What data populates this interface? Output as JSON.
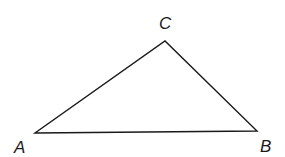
{
  "diagram": {
    "type": "triangle",
    "stroke_color": "#1a1a1a",
    "background": "#ffffff",
    "vertices": [
      {
        "name": "A",
        "x": 35,
        "y": 133,
        "label": "A",
        "label_x": 14,
        "label_y": 153
      },
      {
        "name": "B",
        "x": 257,
        "y": 131,
        "label": "B",
        "label_x": 260,
        "label_y": 152
      },
      {
        "name": "C",
        "x": 165,
        "y": 41,
        "label": "C",
        "label_x": 159,
        "label_y": 29
      }
    ]
  }
}
